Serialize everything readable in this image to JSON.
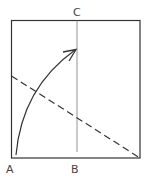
{
  "diagram": {
    "labels": {
      "a": "A",
      "b": "B",
      "c": "C"
    },
    "square": {
      "x": 11,
      "y": 20,
      "width": 129,
      "height": 138
    },
    "vertical_line": {
      "x": 77,
      "from": "C",
      "to": "B"
    },
    "dashed_line": {
      "from": [
        11,
        76
      ],
      "to": [
        140,
        158
      ]
    },
    "curved_arrow": {
      "from": "A",
      "to": "line-CB"
    },
    "colors": {
      "stroke": "#333333",
      "thin_line": "#777777",
      "background": "#ffffff"
    }
  }
}
